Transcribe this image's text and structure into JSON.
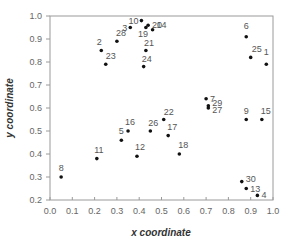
{
  "chart_data": {
    "type": "scatter",
    "title": "",
    "xlabel": "x coordinate",
    "ylabel": "y coordinate",
    "xlim": [
      0.0,
      1.0
    ],
    "ylim": [
      0.2,
      1.0
    ],
    "xticks": [
      "0.0",
      "0.1",
      "0.2",
      "0.3",
      "0.4",
      "0.5",
      "0.6",
      "0.7",
      "0.8",
      "0.9",
      "1.0"
    ],
    "yticks": [
      "0.2",
      "0.3",
      "0.4",
      "0.5",
      "0.6",
      "0.7",
      "0.8",
      "0.9",
      "1.0"
    ],
    "grid": false,
    "legend": null,
    "colors": {
      "point": "#111111",
      "axis": "#888888",
      "label": "#555555",
      "tick": "#666666"
    },
    "points": [
      {
        "label": "1",
        "x": 0.97,
        "y": 0.79
      },
      {
        "label": "2",
        "x": 0.23,
        "y": 0.85
      },
      {
        "label": "3",
        "x": 0.36,
        "y": 0.95
      },
      {
        "label": "4",
        "x": 0.93,
        "y": 0.22
      },
      {
        "label": "5",
        "x": 0.32,
        "y": 0.46
      },
      {
        "label": "6",
        "x": 0.88,
        "y": 0.91
      },
      {
        "label": "7",
        "x": 0.7,
        "y": 0.64
      },
      {
        "label": "8",
        "x": 0.05,
        "y": 0.3
      },
      {
        "label": "9",
        "x": 0.88,
        "y": 0.55
      },
      {
        "label": "10",
        "x": 0.41,
        "y": 0.98
      },
      {
        "label": "11",
        "x": 0.21,
        "y": 0.38
      },
      {
        "label": "12",
        "x": 0.39,
        "y": 0.39
      },
      {
        "label": "13",
        "x": 0.88,
        "y": 0.25
      },
      {
        "label": "14",
        "x": 0.46,
        "y": 0.94
      },
      {
        "label": "15",
        "x": 0.95,
        "y": 0.55
      },
      {
        "label": "16",
        "x": 0.35,
        "y": 0.5
      },
      {
        "label": "17",
        "x": 0.53,
        "y": 0.48
      },
      {
        "label": "18",
        "x": 0.58,
        "y": 0.4
      },
      {
        "label": "19",
        "x": 0.43,
        "y": 0.95
      },
      {
        "label": "20",
        "x": 0.44,
        "y": 0.96
      },
      {
        "label": "21",
        "x": 0.43,
        "y": 0.85
      },
      {
        "label": "22",
        "x": 0.51,
        "y": 0.55
      },
      {
        "label": "23",
        "x": 0.25,
        "y": 0.79
      },
      {
        "label": "24",
        "x": 0.42,
        "y": 0.78
      },
      {
        "label": "25",
        "x": 0.9,
        "y": 0.82
      },
      {
        "label": "26",
        "x": 0.45,
        "y": 0.5
      },
      {
        "label": "27",
        "x": 0.71,
        "y": 0.6
      },
      {
        "label": "28",
        "x": 0.3,
        "y": 0.89
      },
      {
        "label": "29",
        "x": 0.71,
        "y": 0.61
      },
      {
        "label": "30",
        "x": 0.86,
        "y": 0.28
      }
    ],
    "label_offsets": {
      "1": [
        0,
        -9,
        "middle"
      ],
      "2": [
        -2,
        -6,
        "middle"
      ],
      "3": [
        -3,
        3,
        "end"
      ],
      "4": [
        4,
        3,
        "start"
      ],
      "5": [
        0,
        -6,
        "middle"
      ],
      "6": [
        0,
        -8,
        "middle"
      ],
      "7": [
        4,
        3,
        "start"
      ],
      "8": [
        0,
        -6,
        "middle"
      ],
      "9": [
        0,
        -6,
        "middle"
      ],
      "10": [
        -3,
        3,
        "end"
      ],
      "11": [
        2,
        -6,
        "middle"
      ],
      "12": [
        3,
        -6,
        "middle"
      ],
      "13": [
        4,
        3,
        "start"
      ],
      "14": [
        4,
        -2,
        "start"
      ],
      "15": [
        4,
        -6,
        "middle"
      ],
      "16": [
        2,
        -6,
        "middle"
      ],
      "17": [
        4,
        -6,
        "middle"
      ],
      "18": [
        4,
        -6,
        "middle"
      ],
      "19": [
        -3,
        9,
        "middle"
      ],
      "20": [
        4,
        3,
        "start"
      ],
      "21": [
        3,
        -5,
        "middle"
      ],
      "22": [
        5,
        -5,
        "middle"
      ],
      "23": [
        5,
        -5,
        "middle"
      ],
      "24": [
        3,
        -5,
        "middle"
      ],
      "25": [
        6,
        -5,
        "middle"
      ],
      "26": [
        3,
        -5,
        "middle"
      ],
      "27": [
        4,
        5,
        "start"
      ],
      "28": [
        4,
        -5,
        "middle"
      ],
      "29": [
        4,
        0,
        "start"
      ],
      "30": [
        4,
        0,
        "start"
      ]
    }
  }
}
